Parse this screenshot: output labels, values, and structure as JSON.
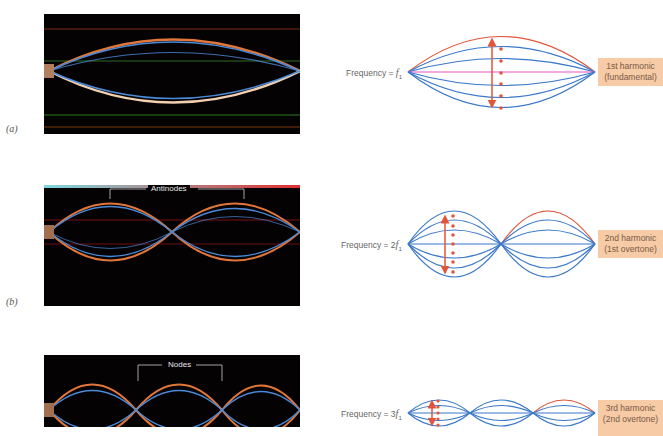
{
  "panels": [
    {
      "letter": "(a)",
      "photo_label": "",
      "frequency_prefix": "Frequency = ",
      "frequency_multiplier": "",
      "frequency_symbol": "f",
      "frequency_subscript": "1",
      "harmonic_line1": "1st harmonic",
      "harmonic_line2": "(fundamental)",
      "loops": 1
    },
    {
      "letter": "(b)",
      "photo_label": "Antinodes",
      "frequency_prefix": "Frequency = ",
      "frequency_multiplier": "2",
      "frequency_symbol": "f",
      "frequency_subscript": "1",
      "harmonic_line1": "2nd harmonic",
      "harmonic_line2": "(1st overtone)",
      "loops": 2
    },
    {
      "letter": "(c)",
      "photo_label": "Nodes",
      "frequency_prefix": "Frequency = ",
      "frequency_multiplier": "3",
      "frequency_symbol": "f",
      "frequency_subscript": "1",
      "harmonic_line1": "3rd harmonic",
      "harmonic_line2": "(2nd overtone)",
      "loops": 3
    }
  ],
  "colors": {
    "string_blue": "#3a78c9",
    "highlight_red": "#e2553a",
    "label_box": "#f6cba6",
    "photo_bg": "#050203"
  }
}
